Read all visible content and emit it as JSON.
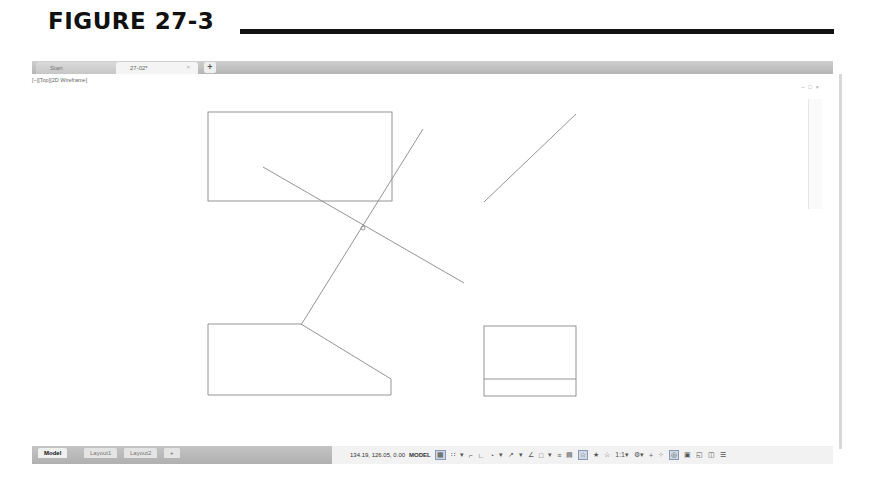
{
  "figure": {
    "title": "FIGURE 27-3"
  },
  "tabs": {
    "items": [
      {
        "label": "Start"
      },
      {
        "label": "27-02*",
        "close": "×"
      }
    ],
    "add": "+"
  },
  "viewport": {
    "label": "[−][Top][2D Wireframe]",
    "controls": "– □ ×"
  },
  "drawing": {
    "stroke_color": "#888888",
    "entities": [
      {
        "type": "rect",
        "name": "upper-rectangle",
        "x": 176,
        "y": 38,
        "w": 184,
        "h": 89
      },
      {
        "type": "line",
        "name": "diagonal-line-a",
        "x1": 231,
        "y1": 93,
        "x2": 432,
        "y2": 209
      },
      {
        "type": "line",
        "name": "diagonal-line-b",
        "x1": 391,
        "y1": 55,
        "x2": 269,
        "y2": 251
      },
      {
        "type": "line",
        "name": "isolated-line",
        "x1": 544,
        "y1": 40,
        "x2": 452,
        "y2": 128
      },
      {
        "type": "polygon",
        "name": "lower-left-profile",
        "points": "176,250 269,250 359,305 359,321 176,321"
      },
      {
        "type": "rect",
        "name": "lower-right-rectangle",
        "x": 452,
        "y": 252,
        "w": 92,
        "h": 70
      },
      {
        "type": "line",
        "name": "lower-right-divider",
        "x1": 452,
        "y1": 305,
        "x2": 544,
        "y2": 305
      },
      {
        "type": "circle",
        "name": "intersection-marker",
        "cx": 331,
        "cy": 154,
        "r": 2
      }
    ]
  },
  "command_line": {
    "buttons": "× 🔧",
    "prompt": "⌨▾",
    "placeholder": "Type a command",
    "scroll": "▴"
  },
  "layout_tabs": {
    "items": [
      {
        "label": "Model",
        "active": true
      },
      {
        "label": "Layout1",
        "active": false
      },
      {
        "label": "Layout2",
        "active": false
      }
    ],
    "add": "+"
  },
  "status": {
    "coordinates": "134.19, 126.05, 0.00",
    "space": "MODEL",
    "icons": [
      {
        "name": "grid-icon",
        "glyph": "▦",
        "on": true
      },
      {
        "name": "snap-icon",
        "glyph": "∷",
        "on": false
      },
      {
        "name": "snap-dropdown-icon",
        "glyph": "▾",
        "on": false
      },
      {
        "name": "infer-constraints-icon",
        "glyph": "⌐",
        "on": false
      },
      {
        "name": "ortho-icon",
        "glyph": "∟",
        "on": false
      },
      {
        "name": "polar-icon",
        "glyph": "◔",
        "on": false
      },
      {
        "name": "polar-dropdown-icon",
        "glyph": "▾",
        "on": false
      },
      {
        "name": "isodraft-icon",
        "glyph": "↗",
        "on": false
      },
      {
        "name": "isodraft-dropdown-icon",
        "glyph": "▾",
        "on": false
      },
      {
        "name": "object-snap-tracking-icon",
        "glyph": "∠",
        "on": false
      },
      {
        "name": "object-snap-icon",
        "glyph": "□",
        "on": false
      },
      {
        "name": "osnap-dropdown-icon",
        "glyph": "▾",
        "on": false
      },
      {
        "name": "lineweight-icon",
        "glyph": "≡",
        "on": false
      },
      {
        "name": "transparency-icon",
        "glyph": "▤",
        "on": false
      },
      {
        "name": "annotation-visibility-icon",
        "glyph": "☆",
        "on": true
      },
      {
        "name": "auto-scale-icon",
        "glyph": "★",
        "on": false
      },
      {
        "name": "annotation-scale-icon",
        "glyph": "☆",
        "on": false
      },
      {
        "name": "scale-label",
        "glyph": "1:1▾",
        "on": false
      },
      {
        "name": "workspace-gear-icon",
        "glyph": "⚙▾",
        "on": false
      },
      {
        "name": "annotation-monitor-icon",
        "glyph": "+",
        "on": false
      },
      {
        "name": "units-icon",
        "glyph": "⁘",
        "on": false
      },
      {
        "name": "isolate-objects-icon",
        "glyph": "◎",
        "on": true
      },
      {
        "name": "hardware-acceleration-icon",
        "glyph": "▣",
        "on": false
      },
      {
        "name": "clean-screen-icon",
        "glyph": "◱",
        "on": false
      },
      {
        "name": "quick-properties-icon",
        "glyph": "◫",
        "on": false
      },
      {
        "name": "customization-menu-icon",
        "glyph": "☰",
        "on": false
      }
    ]
  }
}
